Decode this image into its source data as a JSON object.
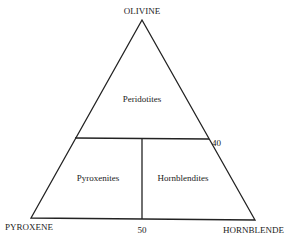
{
  "diagram": {
    "type": "ternary-classification",
    "vertices": {
      "top": "OLIVINE",
      "bottom_left": "PYROXENE",
      "bottom_right": "HORNBLENDE"
    },
    "fields": {
      "top": "Peridotites",
      "bottom_left": "Pyroxenites",
      "bottom_right": "Hornblendites"
    },
    "ticks": {
      "olivine_boundary": "40",
      "base_split": "50"
    },
    "boundaries": {
      "olivine_percent": 40,
      "hornblende_split_percent": 50
    },
    "line_color": "#222222"
  }
}
